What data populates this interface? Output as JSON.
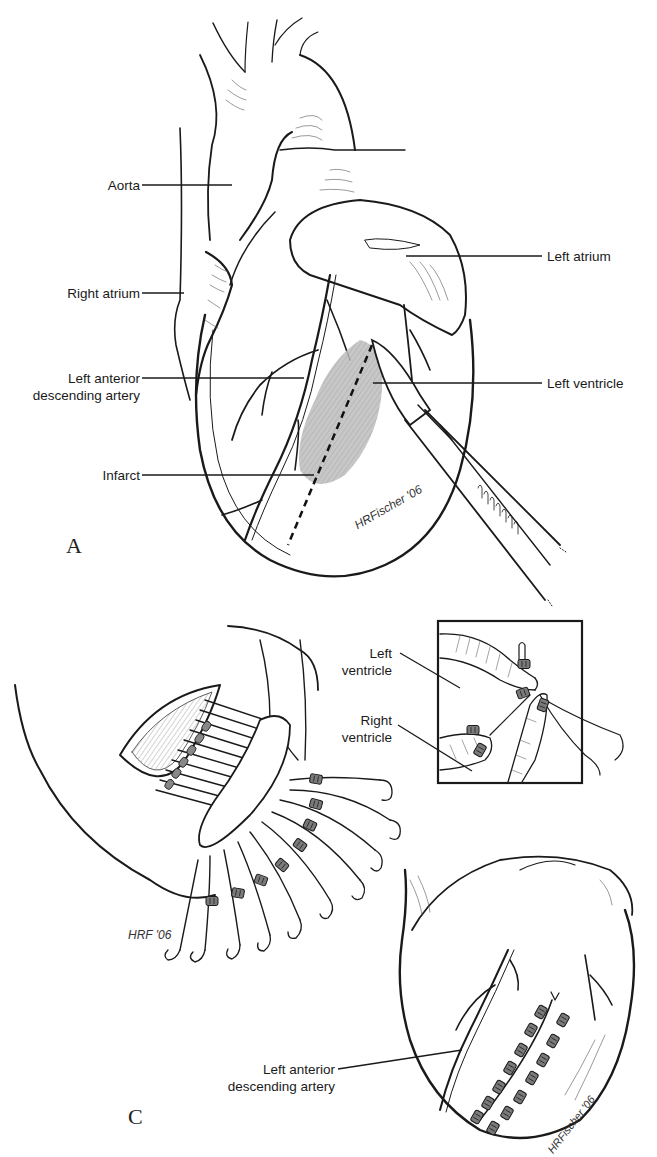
{
  "figure": {
    "panels": [
      {
        "id": "A",
        "label": "A",
        "description": "Anterior view of heart with infarct and scalpel incision line",
        "callouts": [
          {
            "text": "Aorta"
          },
          {
            "text": "Left atrium"
          },
          {
            "text": "Right atrium"
          },
          {
            "text": "Left anterior",
            "text2": "descending artery"
          },
          {
            "text": "Left ventricle"
          },
          {
            "text": "Infarct"
          }
        ],
        "signature": "HRFischer '06"
      },
      {
        "id": "B",
        "description": "Ventriculotomy with pledgeted mattress sutures and inset cross-section",
        "inset_callouts": [
          {
            "text": "Left",
            "text2": "ventricle"
          },
          {
            "text": "Right",
            "text2": "ventricle"
          }
        ],
        "signature": "HRF '06"
      },
      {
        "id": "C",
        "label": "C",
        "description": "Closed ventriculotomy with two rows of pledgets beside LAD",
        "callouts": [
          {
            "text": "Left anterior",
            "text2": "descending artery"
          }
        ],
        "signature": "HRFischer '06"
      }
    ],
    "colors": {
      "line": "#1a1a1a",
      "infarct": "#b9b9b9",
      "pledget": "#7a7a7a",
      "background": "#ffffff"
    }
  }
}
